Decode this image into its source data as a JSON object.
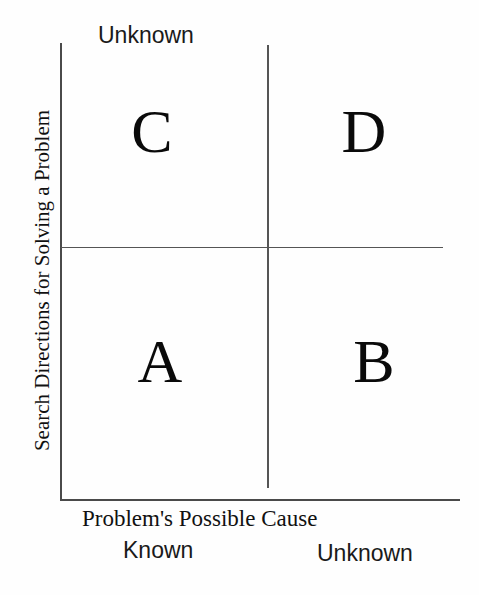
{
  "diagram": {
    "type": "2x2-quadrant-matrix",
    "background_color": "#fefefe",
    "line_color": "#4a4a4a",
    "text_color": "#111111"
  },
  "axes": {
    "y_axis_label": "Search Directions for Solving a Problem",
    "y_axis_top_tick": "Unknown",
    "x_axis_label": "Problem's Possible Cause",
    "x_axis_left_tick": "Known",
    "x_axis_right_tick": "Unknown"
  },
  "quadrants": [
    {
      "id": "top-left",
      "label": "C",
      "x_state": "Known",
      "y_state": "Unknown"
    },
    {
      "id": "top-right",
      "label": "D",
      "x_state": "Unknown",
      "y_state": "Unknown"
    },
    {
      "id": "bottom-left",
      "label": "A",
      "x_state": "Known",
      "y_state": "Known"
    },
    {
      "id": "bottom-right",
      "label": "B",
      "x_state": "Unknown",
      "y_state": "Known"
    }
  ]
}
